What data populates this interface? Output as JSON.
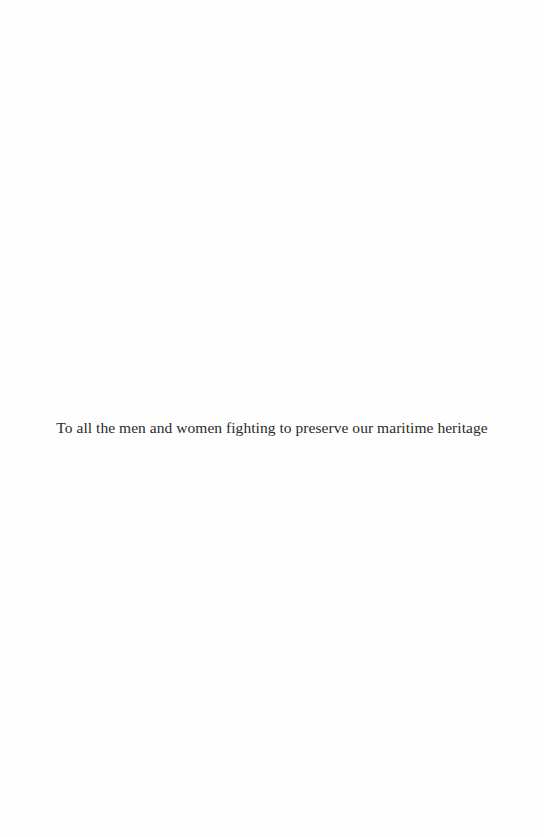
{
  "page": {
    "dedication": "To all the men and women fighting to preserve our maritime heritage"
  }
}
